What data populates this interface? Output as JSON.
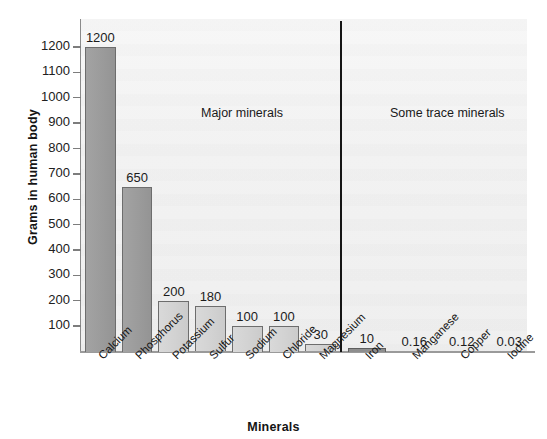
{
  "chart_data": {
    "type": "bar",
    "title": "",
    "xlabel": "Minerals",
    "ylabel": "Grams in human body",
    "ylim": [
      0,
      1250
    ],
    "grid": false,
    "legend": "none",
    "categories": [
      "Calcium",
      "Phosphorus",
      "Potassium",
      "Sulfur",
      "Sodium",
      "Chloride",
      "Magnesium",
      "Iron",
      "Manganese",
      "Copper",
      "Iodine"
    ],
    "values": [
      1200,
      650,
      200,
      180,
      100,
      100,
      30,
      10,
      0.16,
      0.12,
      0.03
    ],
    "value_labels": [
      "1200",
      "650",
      "200",
      "180",
      "100",
      "100",
      "30",
      "10",
      "0.16",
      "0.12",
      "0.03"
    ],
    "yticks": [
      100,
      200,
      300,
      400,
      500,
      600,
      700,
      800,
      900,
      1000,
      1100,
      1200
    ],
    "ytick_labels": [
      "100",
      "200",
      "300",
      "400",
      "500",
      "600",
      "700",
      "800",
      "900",
      "1000",
      "1100",
      "1200"
    ],
    "groups": [
      {
        "name": "Major minerals",
        "members": [
          "Calcium",
          "Phosphorus",
          "Potassium",
          "Sulfur",
          "Sodium",
          "Chloride",
          "Magnesium"
        ]
      },
      {
        "name": "Some trace minerals",
        "members": [
          "Iron",
          "Manganese",
          "Copper",
          "Iodine"
        ]
      }
    ],
    "bar_shades": [
      "dark",
      "dark",
      "light",
      "light",
      "light",
      "light",
      "light",
      "tiny",
      "none",
      "none",
      "none"
    ],
    "colors": {
      "bar_dark": "#9b9b9b",
      "bar_light": "#d2d2d2",
      "bar_outline": "#6d6d6d",
      "divider": "#151515",
      "axis": "#8a8a8a",
      "plot_background": "#f2f2f2",
      "text": "#1a1a1a"
    }
  },
  "annotations": {
    "major": "Major minerals",
    "trace": "Some trace minerals"
  }
}
